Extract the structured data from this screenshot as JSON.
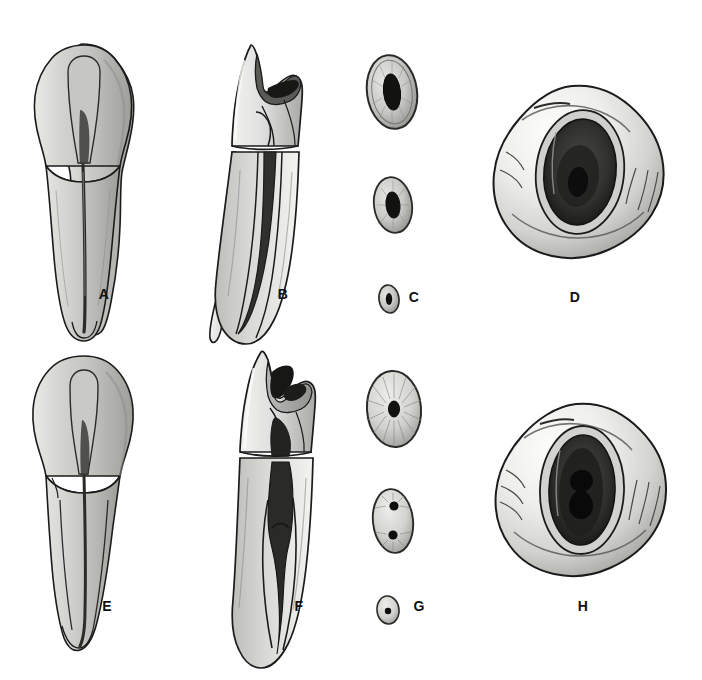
{
  "figure": {
    "background_color": "#ffffff",
    "ink_color": "#111111",
    "rows": 2,
    "columns": 4,
    "label_style": "bold-uppercase-serifless"
  },
  "panels": [
    {
      "id": "A",
      "label": "A",
      "label_x": 104,
      "label_y": 299,
      "view": "labial-view-whole-tooth",
      "row": 1,
      "column": 1,
      "description": "Facial (labial) view of first premolar with pulp chamber and single tapering root canal shown through the tooth",
      "canal_count": 1,
      "cx": 80,
      "cy": 185
    },
    {
      "id": "B",
      "label": "B",
      "label_x": 283,
      "label_y": 299,
      "view": "proximal-view-sectioned",
      "row": 1,
      "column": 2,
      "description": "Mesial (proximal) view, longitudinal section exposing pulp horn, pulp chamber and a single broad root canal",
      "canal_count": 1,
      "cx": 250,
      "cy": 190
    },
    {
      "id": "C",
      "label": "C",
      "label_x": 414,
      "label_y": 302,
      "view": "root-cross-sections",
      "row": 1,
      "column": 3,
      "description": "Three transverse root sections taken at cervix, mid-root and apex; each shows one oval canal",
      "canal_count": 1,
      "sections": [
        {
          "level": "cervical-third",
          "cx": 392,
          "cy": 92,
          "rx": 25,
          "ry": 37,
          "canals": 1,
          "canal_shape": "oval-elongated"
        },
        {
          "level": "middle-third",
          "cx": 393,
          "cy": 205,
          "rx": 19,
          "ry": 28,
          "canals": 1,
          "canal_shape": "oval"
        },
        {
          "level": "apical-third",
          "cx": 389,
          "cy": 299,
          "rx": 10,
          "ry": 14,
          "canals": 1,
          "canal_shape": "round-small"
        }
      ]
    },
    {
      "id": "D",
      "label": "D",
      "label_x": 575,
      "label_y": 302,
      "view": "occlusal-view-pulp-chamber",
      "row": 1,
      "column": 4,
      "description": "Occlusal view looking into the opened pulp chamber — single oval orifice",
      "canal_count": 1,
      "cx": 578,
      "cy": 172
    },
    {
      "id": "E",
      "label": "E",
      "label_x": 107,
      "label_y": 611,
      "view": "labial-view-whole-tooth",
      "row": 2,
      "column": 1,
      "description": "Facial (labial) view of second premolar with narrow pulp chamber and single canal",
      "canal_count": 1,
      "cx": 82,
      "cy": 490
    },
    {
      "id": "F",
      "label": "F",
      "label_x": 299,
      "label_y": 611,
      "view": "proximal-view-sectioned",
      "row": 2,
      "column": 2,
      "description": "Mesial (proximal) view, longitudinal section showing pulp horn, pulp chamber, and a canal that bifurcates toward the apex",
      "canal_count": 2,
      "cx": 268,
      "cy": 490
    },
    {
      "id": "G",
      "label": "G",
      "label_x": 419,
      "label_y": 611,
      "view": "root-cross-sections",
      "row": 2,
      "column": 3,
      "description": "Three transverse root sections; middle section shows two separate canals",
      "canal_count": 2,
      "sections": [
        {
          "level": "cervical-third",
          "cx": 394,
          "cy": 409,
          "rx": 27,
          "ry": 38,
          "canals": 1,
          "canal_shape": "round-small"
        },
        {
          "level": "middle-third",
          "cx": 393,
          "cy": 521,
          "rx": 20,
          "ry": 32,
          "canals": 2,
          "canal_shape": "two-round"
        },
        {
          "level": "apical-third",
          "cx": 388,
          "cy": 610,
          "rx": 11,
          "ry": 14,
          "canals": 1,
          "canal_shape": "round-small"
        }
      ]
    },
    {
      "id": "H",
      "label": "H",
      "label_x": 583,
      "label_y": 611,
      "view": "occlusal-view-pulp-chamber",
      "row": 2,
      "column": 4,
      "description": "Occlusal view into the opened pulp chamber — elongated orifice with two canal openings",
      "canal_count": 2,
      "cx": 580,
      "cy": 490
    }
  ],
  "palette": {
    "outline": "#1b1b1b",
    "enamel_light": "#f4f4f2",
    "enamel_mid": "#d9d9d6",
    "dentin_shade": "#b9b9b5",
    "deep_shade": "#8a8a87",
    "pulp_dark": "#1a1a1a",
    "paper": "#ffffff"
  }
}
